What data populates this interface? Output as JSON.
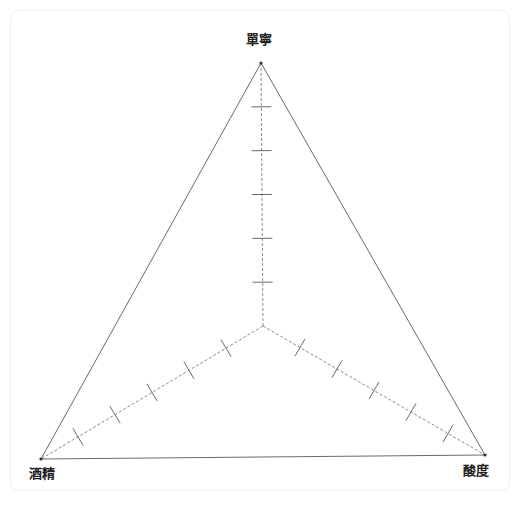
{
  "chart_data": {
    "type": "radar",
    "title": "",
    "axes": [
      {
        "name": "單寧",
        "position": "top"
      },
      {
        "name": "酸度",
        "position": "bottom-right"
      },
      {
        "name": "酒精",
        "position": "bottom-left"
      }
    ],
    "series": [],
    "tick_count": 5,
    "grid": "axis-ticks",
    "legend": "none"
  },
  "geometry": {
    "center": [
      263,
      326
    ],
    "vertices": {
      "top": [
        261,
        63
      ],
      "right": [
        485,
        455
      ],
      "left": [
        41,
        459
      ]
    },
    "divisions": 6,
    "tick_half_length": 10
  },
  "labels": {
    "top": "單寧",
    "right": "酸度",
    "left": "酒精"
  },
  "colors": {
    "outline": "#6a6a6a",
    "axis": "#8a8a8a",
    "tick": "#6a6a6a",
    "vertex_dot": "#333333",
    "card_border": "#f0f0f0"
  }
}
